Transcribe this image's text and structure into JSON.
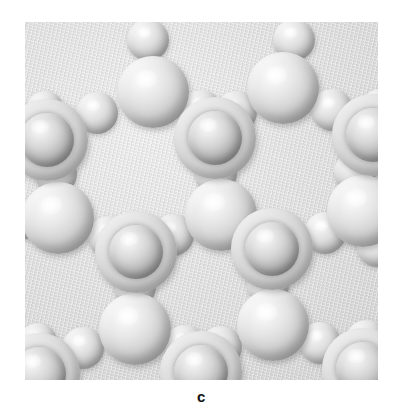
{
  "figure": {
    "caption_label": "c",
    "background_color": "#ffffff",
    "panel": {
      "x": 25,
      "y": 22,
      "width": 353,
      "height": 358,
      "background_color": "#dddddd"
    },
    "caption": {
      "x": 25,
      "y": 384,
      "width": 353,
      "height": 26,
      "font_size": 15,
      "color": "#111111"
    }
  },
  "legend": {
    "atom_types": [
      {
        "key": "large",
        "name": "large-sphere",
        "color": "#d2d2d2"
      },
      {
        "key": "ringed",
        "name": "shelled-sphere",
        "color": "#bdbdbd"
      },
      {
        "key": "small",
        "name": "bridging-sphere",
        "color": "#c2c2c2"
      }
    ]
  },
  "structure": {
    "description": "hexagonal framework network of large spheres bridged by small spheres",
    "atoms": [
      {
        "id": "a01",
        "type": "small",
        "x": 123,
        "y": 18,
        "r": 21
      },
      {
        "id": "a02",
        "type": "small",
        "x": 269,
        "y": 18,
        "r": 21
      },
      {
        "id": "a03",
        "type": "large",
        "x": 128,
        "y": 70,
        "r": 36
      },
      {
        "id": "a04",
        "type": "large",
        "x": 258,
        "y": 66,
        "r": 36
      },
      {
        "id": "a05",
        "type": "small",
        "x": 72,
        "y": 91,
        "r": 21
      },
      {
        "id": "a06",
        "type": "small",
        "x": 176,
        "y": 89,
        "r": 21
      },
      {
        "id": "a07",
        "type": "small",
        "x": 211,
        "y": 90,
        "r": 21
      },
      {
        "id": "a08",
        "type": "small",
        "x": 307,
        "y": 88,
        "r": 21
      },
      {
        "id": "a09",
        "type": "ringed",
        "x": 22,
        "y": 118,
        "r": 41
      },
      {
        "id": "a10",
        "type": "ringed",
        "x": 190,
        "y": 116,
        "r": 41
      },
      {
        "id": "a11",
        "type": "ringed",
        "x": 348,
        "y": 113,
        "r": 41
      },
      {
        "id": "a12",
        "type": "small",
        "x": 20,
        "y": 88,
        "r": 19
      },
      {
        "id": "a13",
        "type": "small",
        "x": 355,
        "y": 86,
        "r": 19
      },
      {
        "id": "a14",
        "type": "small",
        "x": 31,
        "y": 152,
        "r": 21
      },
      {
        "id": "a15",
        "type": "small",
        "x": 191,
        "y": 152,
        "r": 21
      },
      {
        "id": "a16",
        "type": "small",
        "x": 330,
        "y": 150,
        "r": 21
      },
      {
        "id": "a17",
        "type": "large",
        "x": 33,
        "y": 196,
        "r": 36
      },
      {
        "id": "a18",
        "type": "large",
        "x": 196,
        "y": 193,
        "r": 36
      },
      {
        "id": "a19",
        "type": "large",
        "x": 338,
        "y": 189,
        "r": 36
      },
      {
        "id": "a20",
        "type": "small",
        "x": 84,
        "y": 215,
        "r": 21
      },
      {
        "id": "a21",
        "type": "small",
        "x": 148,
        "y": 213,
        "r": 21
      },
      {
        "id": "a22",
        "type": "small",
        "x": 248,
        "y": 211,
        "r": 21
      },
      {
        "id": "a23",
        "type": "small",
        "x": 300,
        "y": 211,
        "r": 21
      },
      {
        "id": "a24",
        "type": "small",
        "x": 0,
        "y": 197,
        "r": 20
      },
      {
        "id": "a25",
        "type": "small",
        "x": 352,
        "y": 225,
        "r": 20
      },
      {
        "id": "a26",
        "type": "ringed",
        "x": 111,
        "y": 230,
        "r": 41
      },
      {
        "id": "a27",
        "type": "ringed",
        "x": 247,
        "y": 227,
        "r": 41
      },
      {
        "id": "a28",
        "type": "small",
        "x": 110,
        "y": 265,
        "r": 21
      },
      {
        "id": "a29",
        "type": "small",
        "x": 243,
        "y": 263,
        "r": 21
      },
      {
        "id": "a30",
        "type": "large",
        "x": 110,
        "y": 307,
        "r": 36
      },
      {
        "id": "a31",
        "type": "large",
        "x": 248,
        "y": 303,
        "r": 36
      },
      {
        "id": "a32",
        "type": "small",
        "x": 58,
        "y": 326,
        "r": 21
      },
      {
        "id": "a33",
        "type": "small",
        "x": 160,
        "y": 324,
        "r": 21
      },
      {
        "id": "a34",
        "type": "small",
        "x": 196,
        "y": 325,
        "r": 21
      },
      {
        "id": "a35",
        "type": "small",
        "x": 295,
        "y": 321,
        "r": 21
      },
      {
        "id": "a36",
        "type": "small",
        "x": 341,
        "y": 318,
        "r": 20
      },
      {
        "id": "a37",
        "type": "ringed",
        "x": 14,
        "y": 352,
        "r": 41
      },
      {
        "id": "a38",
        "type": "ringed",
        "x": 176,
        "y": 350,
        "r": 41
      },
      {
        "id": "a39",
        "type": "ringed",
        "x": 338,
        "y": 347,
        "r": 41
      },
      {
        "id": "a40",
        "type": "small",
        "x": 13,
        "y": 320,
        "r": 19
      },
      {
        "id": "a41",
        "type": "small",
        "x": 48,
        "y": 380,
        "r": 18
      },
      {
        "id": "a42",
        "type": "small",
        "x": 205,
        "y": 382,
        "r": 18
      }
    ]
  }
}
